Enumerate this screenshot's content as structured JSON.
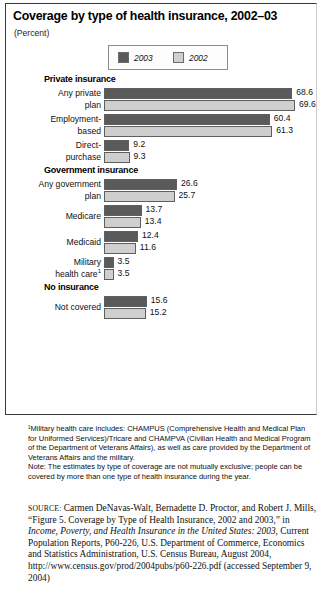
{
  "figure": {
    "title": "Coverage by type of health insurance, 2002–03",
    "subtitle": "(Percent)",
    "legend": [
      {
        "label": "2003",
        "color": "#5a5a5a"
      },
      {
        "label": "2002",
        "color": "#cfcfcf"
      }
    ]
  },
  "chart_data": {
    "type": "bar",
    "orientation": "horizontal",
    "title": "Coverage by type of health insurance, 2002–03",
    "xlabel": "Percent",
    "ylabel": "",
    "xlim": [
      0,
      70
    ],
    "grid": false,
    "legend_position": "top-center",
    "series": [
      {
        "name": "2003",
        "color": "#5a5a5a",
        "values": [
          68.6,
          60.4,
          9.2,
          26.6,
          13.7,
          12.4,
          3.5,
          15.6
        ]
      },
      {
        "name": "2002",
        "color": "#cfcfcf",
        "values": [
          69.6,
          61.3,
          9.3,
          25.7,
          13.4,
          11.6,
          3.5,
          15.2
        ]
      }
    ],
    "categories": [
      "Any private plan",
      "Employment-based",
      "Direct-purchase",
      "Any government plan",
      "Medicare",
      "Medicaid",
      "Military health care",
      "Not covered"
    ],
    "groups": [
      {
        "heading": "Private insurance",
        "rows": [
          {
            "label_lines": [
              "Any private",
              "plan"
            ],
            "footnote": "",
            "v2003": 68.6,
            "v2002": 69.6
          },
          {
            "label_lines": [
              "Employment-",
              "based"
            ],
            "footnote": "",
            "v2003": 60.4,
            "v2002": 61.3
          },
          {
            "label_lines": [
              "Direct-",
              "purchase"
            ],
            "footnote": "",
            "v2003": 9.2,
            "v2002": 9.3
          }
        ]
      },
      {
        "heading": "Government insurance",
        "rows": [
          {
            "label_lines": [
              "Any government",
              "plan"
            ],
            "footnote": "",
            "v2003": 26.6,
            "v2002": 25.7
          },
          {
            "label_lines": [
              "Medicare"
            ],
            "footnote": "",
            "v2003": 13.7,
            "v2002": 13.4
          },
          {
            "label_lines": [
              "Medicaid"
            ],
            "footnote": "",
            "v2003": 12.4,
            "v2002": 11.6
          },
          {
            "label_lines": [
              "Military",
              "health care"
            ],
            "footnote": "1",
            "v2003": 3.5,
            "v2002": 3.5
          }
        ]
      },
      {
        "heading": "No insurance",
        "rows": [
          {
            "label_lines": [
              "Not covered"
            ],
            "footnote": "",
            "v2003": 15.6,
            "v2002": 15.2
          }
        ]
      }
    ]
  },
  "notes": {
    "footnote": "¹Military health care includes: CHAMPUS (Comprehensive Health and Medical Plan for Uniformed Services)/Tricare and CHAMPVA (Civilian Health and Medical Program of the Department of Veterans Affairs), as well as care provided by the Department of Veterans Affairs and the military.",
    "note": "Note: The estimates by type of coverage are not mutually exclusive; people can be covered by more than one type of health insurance during the year."
  },
  "source": {
    "label": "SOURCE:",
    "text_1": " Carmen DeNavas-Walt, Bernadette D. Proctor, and Robert J. Mills, “Figure 5. Coverage by Type of Health Insurance, 2002 and 2003,” in ",
    "italic_1": "Income, Poverty, and Health Insurance in the United States: 2003,",
    "text_2": " Current Population Reports, P60-226, U.S. Department of Commerce, Economics and Statistics Administration, U.S. Census Bureau, August 2004, http://www.census.gov/prod/2004pubs/p60-226.pdf (accessed September 9, 2004)"
  }
}
